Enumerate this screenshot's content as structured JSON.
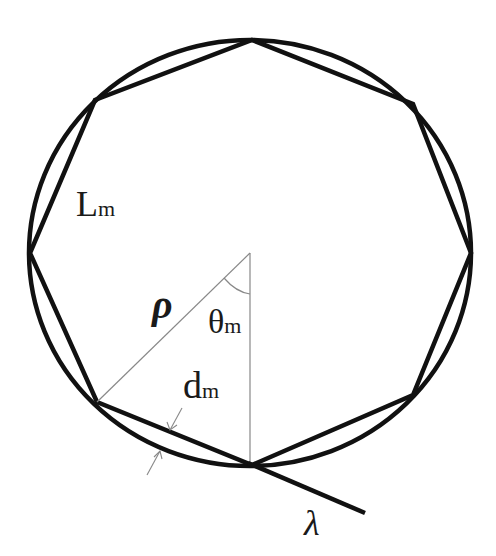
{
  "figure": {
    "colors": {
      "stroke": "#111111",
      "thin": "#888888",
      "background": "#ffffff"
    },
    "labels": {
      "side_length": {
        "main": "L",
        "sub": "m"
      },
      "radius": {
        "main": "ρ"
      },
      "angle": {
        "main": "θ",
        "sub": "m"
      },
      "gap": {
        "main": "d",
        "sub": "m"
      },
      "line": {
        "main": "λ"
      }
    },
    "shapes": {
      "circle": {
        "cx": 250,
        "cy": 253,
        "rx": 221,
        "ry": 213
      },
      "octagon_vertices": [
        [
          252,
          40
        ],
        [
          413,
          104
        ],
        [
          471,
          253
        ],
        [
          413,
          395
        ],
        [
          252,
          465
        ],
        [
          97,
          402
        ],
        [
          30,
          253
        ],
        [
          95,
          100
        ]
      ]
    }
  }
}
